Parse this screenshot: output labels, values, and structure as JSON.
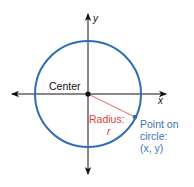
{
  "diagram": {
    "axes": {
      "x_label": "x",
      "y_label": "y"
    },
    "labels": {
      "center": "Center",
      "radius_line1": "Radius:",
      "radius_line2": "r",
      "point_line1": "Point on",
      "point_line2": "circle:",
      "point_line3": "(x, y)"
    },
    "colors": {
      "circle": "#2f6db5",
      "radius": "#e0403a",
      "axes": "#111111",
      "point_text": "#3a73b8"
    }
  }
}
